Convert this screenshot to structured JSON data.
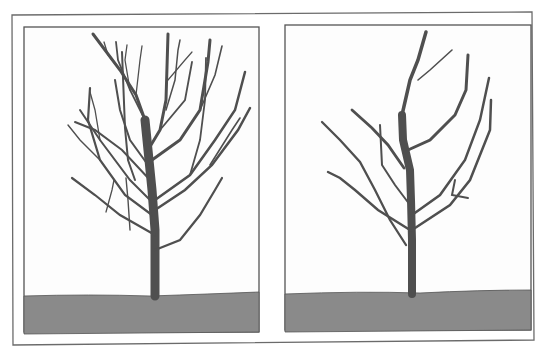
{
  "figure": {
    "panels": [
      {
        "id": "before",
        "label": "",
        "state": "unpruned"
      },
      {
        "id": "after",
        "label": "",
        "state": "pruned"
      }
    ]
  },
  "colors": {
    "background": "#ffffff",
    "frame": "#6b6b6b",
    "branch": "#4f4f4f",
    "ground": "#8a8a8a",
    "panel_bg": "#fdfdfd"
  }
}
